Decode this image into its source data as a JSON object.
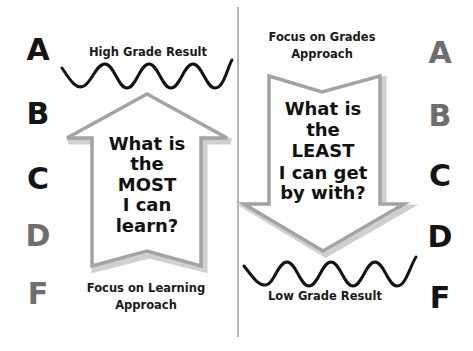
{
  "left_panel": {
    "approach_title": [
      "Focus on Learning",
      "Approach"
    ],
    "result_label": "High Grade Result",
    "arrow_direction": "up",
    "question_lines": [
      "What is",
      "the",
      "MOST",
      "I can",
      "learn?"
    ],
    "grades": [
      {
        "letter": "A",
        "emphasis": "dark"
      },
      {
        "letter": "B",
        "emphasis": "dark"
      },
      {
        "letter": "C",
        "emphasis": "dark"
      },
      {
        "letter": "D",
        "emphasis": "light"
      },
      {
        "letter": "F",
        "emphasis": "light"
      }
    ]
  },
  "right_panel": {
    "approach_title": [
      "Focus on Grades",
      "Approach"
    ],
    "result_label": "Low Grade Result",
    "arrow_direction": "down",
    "question_lines": [
      "What is",
      "the",
      "LEAST",
      "I can get",
      "by with?"
    ],
    "grades": [
      {
        "letter": "A",
        "emphasis": "light"
      },
      {
        "letter": "B",
        "emphasis": "light"
      },
      {
        "letter": "C",
        "emphasis": "dark"
      },
      {
        "letter": "D",
        "emphasis": "dark"
      },
      {
        "letter": "F",
        "emphasis": "dark"
      }
    ]
  },
  "colors": {
    "dark_grade": "#141414",
    "light_grade": "#6e6e6e",
    "arrow_outline": "#a3a3a3",
    "arrow_shadow": "#cfcfcf",
    "divider": "#9a9a9a",
    "wave": "#111111"
  }
}
